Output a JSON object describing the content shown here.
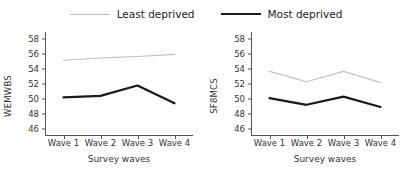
{
  "legend": {
    "items": [
      {
        "label": "Least deprived",
        "color": "#bfbfbf",
        "style": "light"
      },
      {
        "label": "Most deprived",
        "color": "#1a1a1a",
        "style": "dark"
      }
    ]
  },
  "colors": {
    "least_deprived": "#bfbfbf",
    "most_deprived": "#1a1a1a",
    "axis": "#555555",
    "text": "#333333",
    "background": "#ffffff"
  },
  "panels": [
    {
      "ylabel": "WEMWBS",
      "xlabel": "Survey waves"
    },
    {
      "ylabel": "SF8MCS",
      "xlabel": "Survey waves"
    }
  ],
  "chart_data": [
    {
      "type": "line",
      "title": "",
      "xlabel": "Survey waves",
      "ylabel": "WEMWBS",
      "categories": [
        "Wave 1",
        "Wave 2",
        "Wave 3",
        "Wave 4"
      ],
      "yticks": [
        46,
        48,
        50,
        52,
        54,
        56,
        58
      ],
      "ylim": [
        45,
        59
      ],
      "grid": false,
      "legend_position": "top-center",
      "series": [
        {
          "name": "Least deprived",
          "color": "#bfbfbf",
          "values": [
            55.2,
            55.5,
            55.7,
            56.0
          ]
        },
        {
          "name": "Most deprived",
          "color": "#1a1a1a",
          "values": [
            50.2,
            50.4,
            51.8,
            49.4
          ]
        }
      ]
    },
    {
      "type": "line",
      "title": "",
      "xlabel": "Survey waves",
      "ylabel": "SF8MCS",
      "categories": [
        "Wave 1",
        "Wave 2",
        "Wave 3",
        "Wave 4"
      ],
      "yticks": [
        46,
        48,
        50,
        52,
        54,
        56,
        58
      ],
      "ylim": [
        45,
        59
      ],
      "grid": false,
      "legend_position": "top-center",
      "series": [
        {
          "name": "Least deprived",
          "color": "#bfbfbf",
          "values": [
            53.7,
            52.3,
            53.7,
            52.2
          ]
        },
        {
          "name": "Most deprived",
          "color": "#1a1a1a",
          "values": [
            50.1,
            49.2,
            50.3,
            48.9
          ]
        }
      ]
    }
  ]
}
